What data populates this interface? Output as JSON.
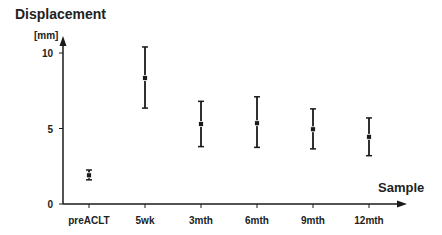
{
  "chart_data": {
    "type": "scatter",
    "subtype": "errorbar",
    "title": "",
    "ylabel": "Displacement",
    "yunit": "[mm]",
    "xlabel": "Sample",
    "categories": [
      "preACLT",
      "5wk",
      "3mth",
      "6mth",
      "9mth",
      "12mth"
    ],
    "series": [
      {
        "name": "Displacement",
        "mean": [
          1.9,
          8.35,
          5.3,
          5.35,
          4.95,
          4.45
        ],
        "upper": [
          2.25,
          10.4,
          6.8,
          7.1,
          6.3,
          5.7
        ],
        "lower": [
          1.6,
          6.35,
          3.8,
          3.75,
          3.65,
          3.2
        ]
      }
    ],
    "yticks": [
      0,
      5,
      10
    ],
    "ytick_labels": [
      "0",
      "5",
      "10"
    ],
    "ylim": [
      0,
      11.5
    ],
    "grid": false,
    "legend": null
  },
  "labels": {
    "ylabel": "Displacement",
    "yunit": "[mm]",
    "xlabel": "Sample"
  },
  "colors": {
    "ink": "#1a1a1a",
    "background": "#ffffff"
  }
}
